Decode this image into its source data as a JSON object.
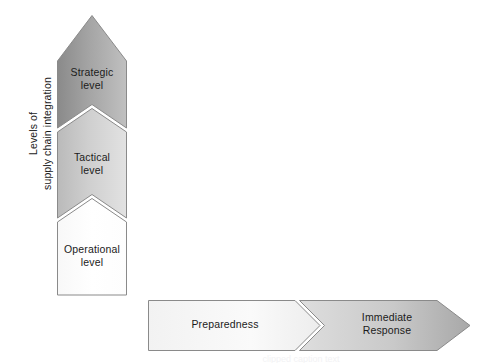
{
  "figure": {
    "type": "diagram",
    "kind": "two-axis-chevron-matrix",
    "background": "#ffffff"
  },
  "vertical_axis": {
    "label_lines": [
      "Levels of",
      "supply chain integration"
    ],
    "direction": "upward-arrow",
    "orientation": "rotated-90-ccw"
  },
  "vertical_stages": [
    {
      "id": "strategic",
      "label_lines": [
        "Strategic",
        "level"
      ],
      "position": "top",
      "shape": "arrow-head",
      "fill_dark": "#8d8d8d",
      "fill_light": "#b9b9b9"
    },
    {
      "id": "tactical",
      "label_lines": [
        "Tactical",
        "level"
      ],
      "position": "middle",
      "shape": "chevron",
      "fill_dark": "#bdbdbd",
      "fill_light": "#dcdcdc"
    },
    {
      "id": "operational",
      "label_lines": [
        "Operational",
        "level"
      ],
      "position": "bottom",
      "shape": "chevron-base",
      "fill_dark": "#fbfbfb",
      "fill_light": "#ffffff"
    }
  ],
  "horizontal_axis": {
    "direction": "rightward-arrow",
    "label_lines": []
  },
  "horizontal_stages": [
    {
      "id": "preparedness",
      "label_lines": [
        "Preparedness"
      ],
      "position": "left",
      "shape": "chevron-base",
      "fill_dark": "#f4f4f4",
      "fill_light": "#fcfcfc"
    },
    {
      "id": "immediate-response",
      "label_lines": [
        "Immediate",
        "Response"
      ],
      "position": "right",
      "shape": "chevron-arrow",
      "fill_dark": "#d2d2d2",
      "fill_light": "#b0b0b0"
    }
  ],
  "styling": {
    "outline_color": "#8a8a8a",
    "separator_color": "#ffffff",
    "text_color": "#1b1b1b"
  },
  "caption_remnant": "clipped caption text"
}
